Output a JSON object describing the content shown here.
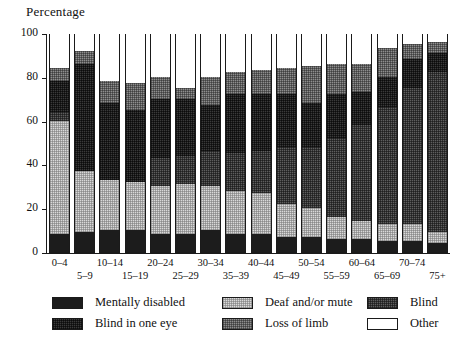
{
  "chart_data": {
    "type": "bar",
    "title": "",
    "ylabel": "Percentage",
    "xlabel": "",
    "ylim": [
      0,
      100
    ],
    "yticks": [
      0,
      20,
      40,
      60,
      80,
      100
    ],
    "grid": false,
    "stacked": true,
    "legend_position": "bottom",
    "categories": [
      "0–4",
      "5–9",
      "10–14",
      "15–19",
      "20–24",
      "25–29",
      "30–34",
      "35–39",
      "40–44",
      "45–49",
      "50–54",
      "55–59",
      "60–64",
      "65–69",
      "70–74",
      "75+"
    ],
    "series": [
      {
        "name": "Mentally disabled",
        "color": "#1c1c1c",
        "pattern": "solid-black",
        "values": [
          8,
          9,
          10,
          10,
          8,
          8,
          10,
          8,
          8,
          7,
          7,
          6,
          6,
          5,
          5,
          4
        ]
      },
      {
        "name": "Deaf and/or mute",
        "color": "#d9d9d9",
        "pattern": "fine-dot-light",
        "values": [
          52,
          28,
          23,
          22,
          22,
          23,
          20,
          20,
          19,
          15,
          13,
          10,
          8,
          8,
          8,
          5
        ]
      },
      {
        "name": "Blind",
        "color": "#5e5e5e",
        "pattern": "dense-dot-dark",
        "values": [
          4,
          0,
          0,
          0,
          13,
          13,
          16,
          17,
          19,
          26,
          28,
          36,
          44,
          53,
          62,
          73
        ]
      },
      {
        "name": "Blind in one eye",
        "color": "#3a3a3a",
        "pattern": "dark-hatch",
        "values": [
          14,
          49,
          35,
          33,
          27,
          26,
          21,
          27,
          26,
          24,
          20,
          20,
          15,
          14,
          13,
          9
        ]
      },
      {
        "name": "Loss of limb",
        "color": "#8e8e8e",
        "pattern": "mid-dot",
        "values": [
          6,
          6,
          10,
          12,
          10,
          5,
          13,
          10,
          11,
          12,
          17,
          14,
          13,
          13,
          7,
          5
        ]
      },
      {
        "name": "Other",
        "color": "#ffffff",
        "pattern": "empty",
        "values": [
          16,
          8,
          22,
          23,
          20,
          25,
          20,
          18,
          17,
          16,
          15,
          14,
          14,
          7,
          5,
          4
        ]
      }
    ]
  },
  "axis": {
    "y_title": "Percentage",
    "y_tick_labels": [
      "0",
      "20",
      "40",
      "60",
      "80",
      "100"
    ],
    "x_tick_labels": [
      "0–4",
      "5–9",
      "10–14",
      "15–19",
      "20–24",
      "25–29",
      "30–34",
      "35–39",
      "40–44",
      "45–49",
      "50–54",
      "55–59",
      "60–64",
      "65–69",
      "70–74",
      "75+"
    ]
  },
  "legend": {
    "entries": [
      {
        "label": "Mentally disabled",
        "swatch": "swatch-mentally-disabled"
      },
      {
        "label": "Blind in one eye",
        "swatch": "swatch-blind-one-eye"
      },
      {
        "label": "Deaf and/or mute",
        "swatch": "swatch-deaf-mute"
      },
      {
        "label": "Loss of limb",
        "swatch": "swatch-loss-of-limb"
      },
      {
        "label": "Blind",
        "swatch": "swatch-blind"
      },
      {
        "label": "Other",
        "swatch": "swatch-other"
      }
    ]
  }
}
